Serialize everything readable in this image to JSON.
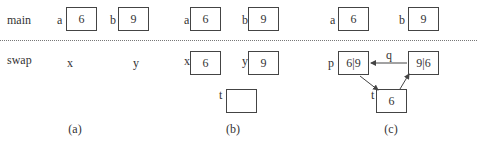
{
  "rows": {
    "main": "main",
    "swap": "swap"
  },
  "panel_a": {
    "a": {
      "label": "a",
      "value": "6"
    },
    "b": {
      "label": "b",
      "value": "9"
    },
    "x": "x",
    "y": "y",
    "caption": "(a)"
  },
  "panel_b": {
    "a": {
      "label": "a",
      "value": "6"
    },
    "b": {
      "label": "b",
      "value": "9"
    },
    "x": {
      "label": "x",
      "value": "6"
    },
    "y": {
      "label": "y",
      "value": "9"
    },
    "t": {
      "label": "t",
      "value": ""
    },
    "caption": "(b)"
  },
  "panel_c": {
    "a": {
      "label": "a",
      "value": "6"
    },
    "b": {
      "label": "b",
      "value": "9"
    },
    "p": {
      "label": "p",
      "value": "6|9"
    },
    "q": {
      "label": "q",
      "value": "9|6"
    },
    "t": {
      "label": "t",
      "value": "6"
    },
    "caption": "(c)"
  },
  "colors": {
    "stroke": "#444444",
    "text": "#333333",
    "divider": "#777777"
  }
}
